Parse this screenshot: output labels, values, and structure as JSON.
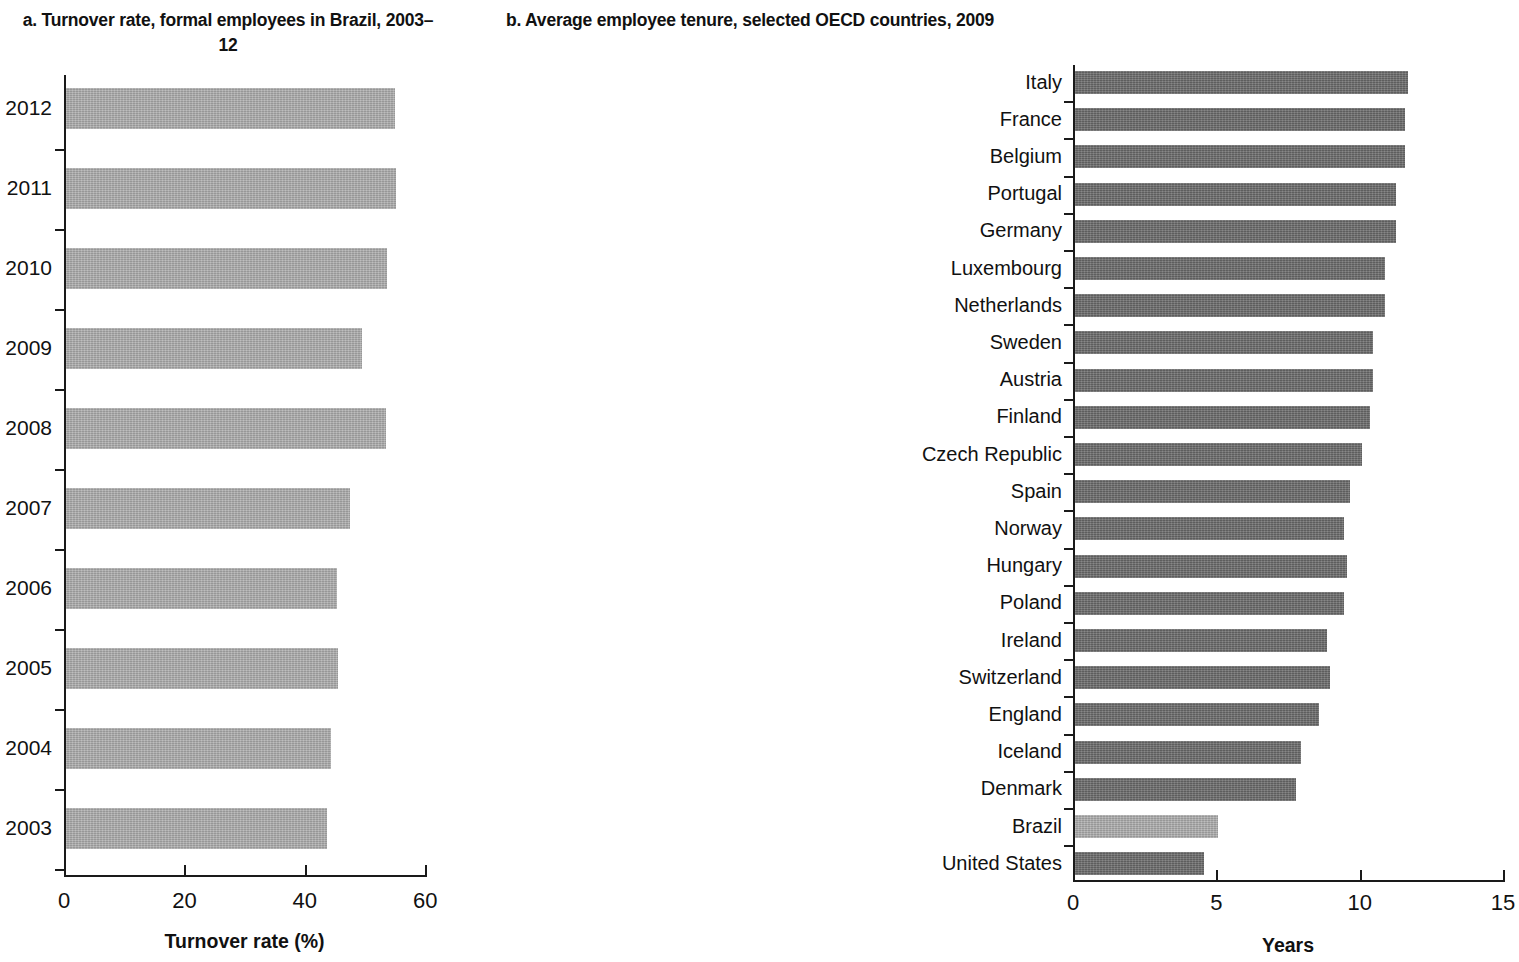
{
  "figure": {
    "panel_a_title": "a. Turnover rate, formal employees in Brazil, 2003–12",
    "panel_b_title": "b. Average employee tenure, selected OECD countries, 2009"
  },
  "chart_data": [
    {
      "id": "panel-a",
      "type": "bar",
      "orientation": "horizontal",
      "title": "a. Turnover rate, formal employees in Brazil, 2003–12",
      "xlabel": "Turnover rate (%)",
      "ylabel": "",
      "xlim": [
        0,
        60
      ],
      "xticks": [
        0,
        20,
        40,
        60
      ],
      "xtick_labels": [
        "0",
        "20",
        "40",
        "60"
      ],
      "grid": false,
      "legend": false,
      "bar_color": "#a9a9a9",
      "categories": [
        "2012",
        "2011",
        "2010",
        "2009",
        "2008",
        "2007",
        "2006",
        "2005",
        "2004",
        "2003"
      ],
      "values": [
        54.6,
        54.8,
        53.3,
        49.2,
        53.2,
        47.2,
        45.0,
        45.2,
        44.0,
        43.4
      ]
    },
    {
      "id": "panel-b",
      "type": "bar",
      "orientation": "horizontal",
      "title": "b. Average employee tenure, selected OECD countries, 2009",
      "xlabel": "Years",
      "ylabel": "",
      "xlim": [
        0,
        15
      ],
      "xticks": [
        0,
        5,
        10,
        15
      ],
      "xtick_labels": [
        "0",
        "5",
        "10",
        "15"
      ],
      "grid": false,
      "legend": false,
      "bar_color": "#6b6b6b",
      "highlight_color": "#a9a9a9",
      "highlight_category": "Brazil",
      "categories": [
        "Italy",
        "France",
        "Belgium",
        "Portugal",
        "Germany",
        "Luxembourg",
        "Netherlands",
        "Sweden",
        "Austria",
        "Finland",
        "Czech Republic",
        "Spain",
        "Norway",
        "Hungary",
        "Poland",
        "Ireland",
        "Switzerland",
        "England",
        "Iceland",
        "Denmark",
        "Brazil",
        "United States"
      ],
      "values": [
        11.6,
        11.5,
        11.5,
        11.2,
        11.2,
        10.8,
        10.8,
        10.4,
        10.4,
        10.3,
        10.0,
        9.6,
        9.4,
        9.5,
        9.4,
        8.8,
        8.9,
        8.5,
        7.9,
        7.7,
        5.0,
        4.5
      ]
    }
  ]
}
